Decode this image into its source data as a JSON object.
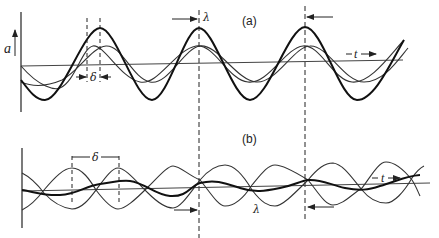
{
  "figure": {
    "panel_a": {
      "label": "(a)",
      "y_axis_label": "a",
      "phase_label": "δ",
      "wavelength_label": "λ",
      "time_label": "t",
      "description": "Two thin waves of equal amplitude, phase-shifted by δ, and their bold in-phase superposition with larger amplitude"
    },
    "panel_b": {
      "label": "(b)",
      "phase_label": "δ",
      "wavelength_label": "λ",
      "time_label": "t",
      "description": "Two thin waves nearly in antiphase and their small-amplitude bold superposition"
    },
    "colors": {
      "ink": "#222222",
      "background": "#ffffff"
    }
  }
}
